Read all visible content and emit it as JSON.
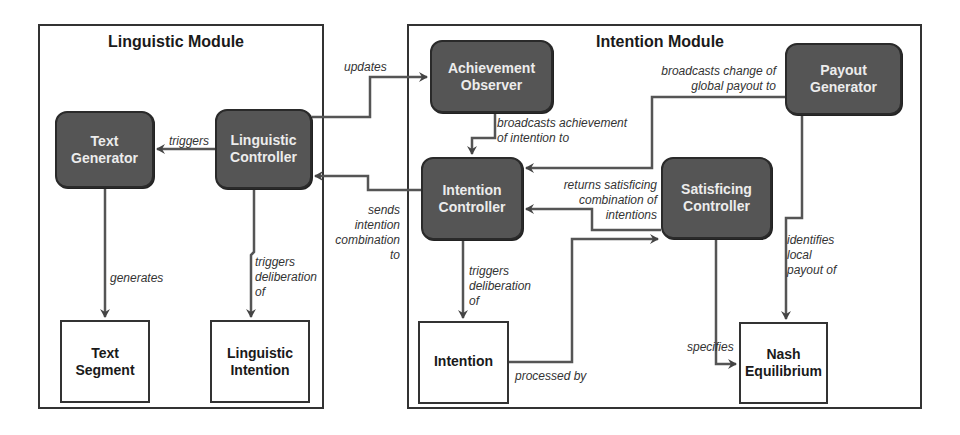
{
  "modules": {
    "linguistic": {
      "title": "Linguistic Module"
    },
    "intention": {
      "title": "Intention Module"
    }
  },
  "nodes": {
    "text_generator": {
      "label": "Text\nGenerator",
      "style": "dark"
    },
    "linguistic_controller": {
      "label": "Linguistic\nController",
      "style": "dark"
    },
    "text_segment": {
      "label": "Text\nSegment",
      "style": "light"
    },
    "linguistic_intention": {
      "label": "Linguistic\nIntention",
      "style": "light"
    },
    "achievement_observer": {
      "label": "Achievement\nObserver",
      "style": "dark"
    },
    "intention_controller": {
      "label": "Intention\nController",
      "style": "dark"
    },
    "payout_generator": {
      "label": "Payout\nGenerator",
      "style": "dark"
    },
    "satisficing_controller": {
      "label": "Satisficing\nController",
      "style": "dark"
    },
    "intention": {
      "label": "Intention",
      "style": "light"
    },
    "nash_equilibrium": {
      "label": "Nash\nEquilibrium",
      "style": "light"
    }
  },
  "edges": {
    "triggers": "triggers",
    "generates": "generates",
    "triggers_deliberation_ling": "triggers\ndeliberation\nof",
    "updates": "updates",
    "sends_intention_combination": "sends\nintention\ncombination\nto",
    "broadcasts_achievement": "broadcasts achievement\nof intention to",
    "broadcasts_change": "broadcasts change of\nglobal payout to",
    "returns_satisficing": "returns satisficing\ncombination of\nintentions",
    "triggers_deliberation_int": "triggers\ndeliberation\nof",
    "processed_by": "processed by",
    "specifies": "specifies",
    "identifies_local_payout": "identifies\nlocal\npayout of"
  },
  "colors": {
    "dark_node_fill": "#555555",
    "dark_node_text": "#ececec",
    "line": "#444444",
    "border": "#333333"
  }
}
